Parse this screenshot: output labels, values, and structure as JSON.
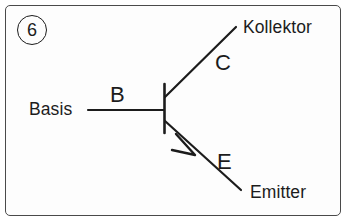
{
  "figure": {
    "number_badge": "6",
    "frame_color": "#4a4a4a",
    "stroke_color": "#1c1c1c",
    "background": "#ffffff",
    "device_type": "npn-bipolar-transistor",
    "language": "de"
  },
  "labels": {
    "base_name": "Basis",
    "base_letter": "B",
    "collector_name": "Kollektor",
    "collector_letter": "C",
    "emitter_name": "Emitter",
    "emitter_letter": "E"
  },
  "geometry": {
    "base_bar": {
      "x": 164,
      "y1": 84,
      "y2": 133
    },
    "base_lead": {
      "x1": 88,
      "x2": 164,
      "y": 110
    },
    "collector_lead": {
      "x1": 166,
      "y1": 96,
      "x2": 236,
      "y2": 27
    },
    "emitter_lead": {
      "x1": 166,
      "y1": 122,
      "x2": 241,
      "y2": 190
    },
    "emitter_arrow_tip": {
      "x": 194,
      "y": 154
    }
  }
}
